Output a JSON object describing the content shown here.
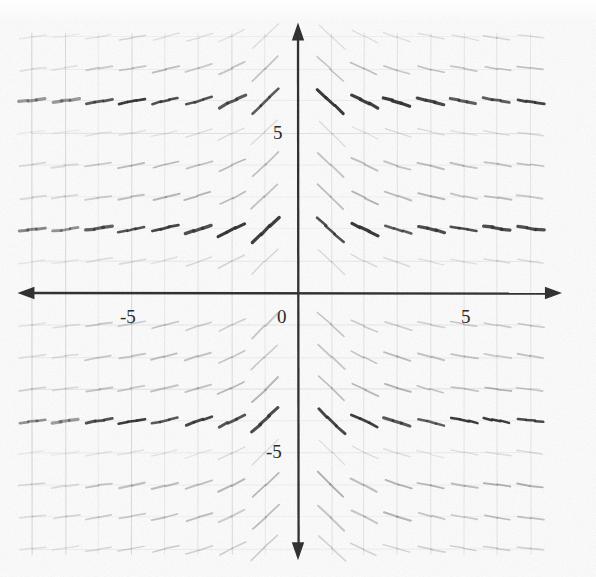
{
  "figure": {
    "kind": "slope-field",
    "title": "",
    "background_color": "#fefefe",
    "axis_color": "#262626",
    "grid_color": "#c9c9cf",
    "label_color": "#2b2b2b"
  },
  "axes": {
    "x_axis": {
      "name": "x-axis",
      "pixel_y": 293,
      "arrow_left": true,
      "arrow_right": true,
      "ticks": [
        {
          "label": "-5",
          "value": -5,
          "pixel_x": 130,
          "pixel_y": 307
        },
        {
          "label": "5",
          "value": 5,
          "pixel_x": 466,
          "pixel_y": 307
        }
      ]
    },
    "y_axis": {
      "name": "y-axis",
      "pixel_x": 298,
      "arrow_up": true,
      "arrow_down": true,
      "ticks": [
        {
          "label": "5",
          "value": 5,
          "pixel_x": 283,
          "pixel_y": 133
        },
        {
          "label": "-5",
          "value": -5,
          "pixel_x": 278,
          "pixel_y": 452
        }
      ]
    },
    "origin": {
      "label": "0",
      "pixel_x": 285,
      "pixel_y": 307
    },
    "unit_px_x": 33.2,
    "unit_px_y": 32.0,
    "xlim": [
      -8.3,
      7.6
    ],
    "ylim": [
      -8.2,
      8.3
    ]
  },
  "chart_data": {
    "type": "scatter",
    "title": "",
    "xlabel": "",
    "ylabel": "",
    "xlim": [
      -8.3,
      7.6
    ],
    "ylim": [
      -8.2,
      8.3
    ],
    "grid": true,
    "legend": null,
    "tick_labels": {
      "x": [
        "-5",
        "0",
        "5"
      ],
      "y": [
        "5",
        "0",
        "-5"
      ]
    },
    "lattice": {
      "x_values": [
        -8,
        -7,
        -6,
        -5,
        -4,
        -3,
        -2,
        -1,
        1,
        2,
        3,
        4,
        5,
        6,
        7
      ],
      "y_values": [
        8,
        7,
        6,
        5,
        4,
        3,
        2,
        1,
        -1,
        -2,
        -3,
        -4,
        -5,
        -6,
        -7,
        -8
      ]
    },
    "row_weights": [
      {
        "y": 8,
        "ink": 0.22
      },
      {
        "y": 7,
        "ink": 0.46
      },
      {
        "y": 6,
        "ink": 0.95
      },
      {
        "y": 5,
        "ink": 0.2
      },
      {
        "y": 4,
        "ink": 0.52
      },
      {
        "y": 3,
        "ink": 0.55
      },
      {
        "y": 2,
        "ink": 0.95
      },
      {
        "y": 1,
        "ink": 0.26
      },
      {
        "y": -1,
        "ink": 0.42
      },
      {
        "y": -2,
        "ink": 0.5
      },
      {
        "y": -3,
        "ink": 0.55
      },
      {
        "y": -4,
        "ink": 0.95
      },
      {
        "y": -5,
        "ink": 0.18
      },
      {
        "y": -6,
        "ink": 0.6
      },
      {
        "y": -7,
        "ink": 0.5
      },
      {
        "y": -8,
        "ink": 0.34
      }
    ],
    "slope_rule": {
      "expression": "dy/dx proportional to -1/x (tilts up-right for x<0, down-right for x>0, flattening as |x| grows)",
      "max_abs_slope": 0.95
    },
    "segment_half_length_px": 13
  }
}
